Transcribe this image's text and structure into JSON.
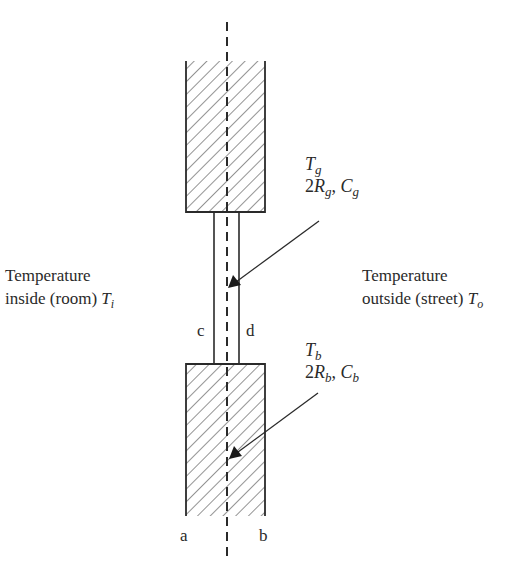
{
  "diagram": {
    "left_label": {
      "line1": "Temperature",
      "line2": "inside (room) ",
      "symbol": "T",
      "subscript": "i"
    },
    "right_label": {
      "line1": "Temperature",
      "line2": "outside (street) ",
      "symbol": "T",
      "subscript": "o"
    },
    "glass": {
      "temp_symbol": "T",
      "temp_sub": "g",
      "resistance_prefix": "2",
      "resistance_symbol": "R",
      "resistance_sub": "g",
      "separator": ", ",
      "capacity_symbol": "C",
      "capacity_sub": "g"
    },
    "wall": {
      "temp_symbol": "T",
      "temp_sub": "b",
      "resistance_prefix": "2",
      "resistance_symbol": "R",
      "resistance_sub": "b",
      "separator": ", ",
      "capacity_symbol": "C",
      "capacity_sub": "b"
    },
    "surface_labels": {
      "a": "a",
      "b": "b",
      "c": "c",
      "d": "d"
    },
    "colors": {
      "line": "#2a2a2a",
      "background": "#ffffff"
    }
  }
}
